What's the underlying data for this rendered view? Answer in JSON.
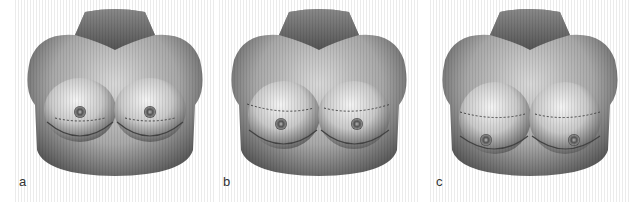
{
  "figure": {
    "panels": [
      {
        "label": "a",
        "description": "torso-illustration-grade-a"
      },
      {
        "label": "b",
        "description": "torso-illustration-grade-b"
      },
      {
        "label": "c",
        "description": "torso-illustration-grade-c"
      }
    ]
  }
}
